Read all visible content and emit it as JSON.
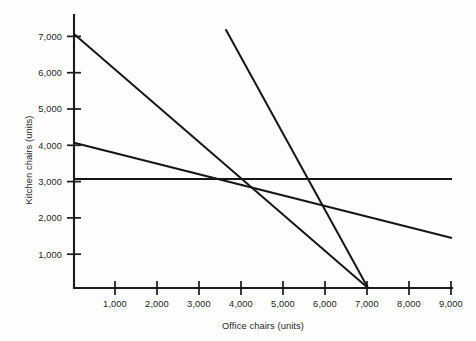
{
  "chart_data": {
    "type": "line",
    "title": "",
    "subtitle": "",
    "xlabel": "Office chairs (units)",
    "ylabel": "Kitchen chairs (units)",
    "xlim": [
      0,
      9300
    ],
    "ylim": [
      0,
      7400
    ],
    "xticks": [
      1000,
      2000,
      3000,
      4000,
      5000,
      6000,
      7000,
      8000,
      9000
    ],
    "xticklabels": [
      "1,000",
      "2,000",
      "3,000",
      "4,000",
      "5,000",
      "6,000",
      "7,000",
      "8,000",
      "9,000"
    ],
    "yticks": [
      1000,
      2000,
      3000,
      4000,
      5000,
      6000,
      7000
    ],
    "yticklabels": [
      "1,000",
      "2,000",
      "3,000",
      "4,000",
      "5,000",
      "6,000",
      "7,000"
    ],
    "grid": false,
    "legend": false,
    "legend_position": "none",
    "line_color": "#161616",
    "axis_color": "#1b1b1b",
    "background_color": "#fdfdfd",
    "series": [
      {
        "name": "constraint-line-1",
        "description": "Steepest downward constraint from y-intercept 7,000 to x-intercept 7,000",
        "points": [
          [
            0,
            7000
          ],
          [
            7000,
            0
          ]
        ],
        "x_intercept": 7000,
        "y_intercept": 7000,
        "slope": -1
      },
      {
        "name": "constraint-line-2",
        "description": "Shallow downward constraint from y-intercept 4,000 falling to about 1,380 at 9,000",
        "points": [
          [
            0,
            4000
          ],
          [
            9000,
            1380
          ]
        ],
        "y_intercept": 4000,
        "slope": -0.291
      },
      {
        "name": "constraint-line-3",
        "description": "Horizontal constraint held at 3,000 kitchen chairs across the full range",
        "points": [
          [
            0,
            3000
          ],
          [
            9000,
            3000
          ]
        ],
        "y_intercept": 3000,
        "slope": 0
      },
      {
        "name": "constraint-line-4",
        "description": "Very steep downward constraint entering top of plot near 3,610 and meeting x-axis at 7,000",
        "points": [
          [
            3610,
            7130
          ],
          [
            7000,
            0
          ]
        ],
        "x_intercept": 7000,
        "slope": -2.103
      }
    ],
    "intersections": [
      {
        "x": 3440,
        "y": 3000,
        "label": "constraint-line-2 meets constraint-line-3"
      },
      {
        "x": 4000,
        "y": 3000,
        "label": "constraint-line-1 meets constraint-line-3"
      },
      {
        "x": 4130,
        "y": 2880,
        "label": "constraint-line-1 meets constraint-line-2"
      },
      {
        "x": 5700,
        "y": 3000,
        "label": "constraint-line-4 meets constraint-line-3"
      },
      {
        "x": 6040,
        "y": 2240,
        "label": "constraint-line-4 meets constraint-line-2"
      },
      {
        "x": 7000,
        "y": 0,
        "label": "constraint-line-1 meets constraint-line-4 at x-axis"
      }
    ]
  }
}
